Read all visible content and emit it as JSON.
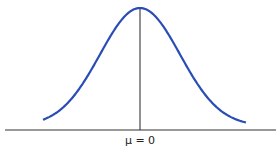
{
  "chart_data": {
    "type": "line",
    "title": "",
    "xlabel": "",
    "ylabel": "",
    "tick_labels": [
      "μ = 0"
    ],
    "series": [
      {
        "name": "normal density",
        "mu": 0,
        "sigma": 1,
        "color": "#2a4db5"
      }
    ],
    "annotations": [
      {
        "type": "vertical-line",
        "x": 0,
        "label": "μ = 0"
      }
    ],
    "grid": false,
    "legend": null
  },
  "axis_label": "μ = 0",
  "colors": {
    "curve": "#2a4db5",
    "axis": "#333333"
  }
}
